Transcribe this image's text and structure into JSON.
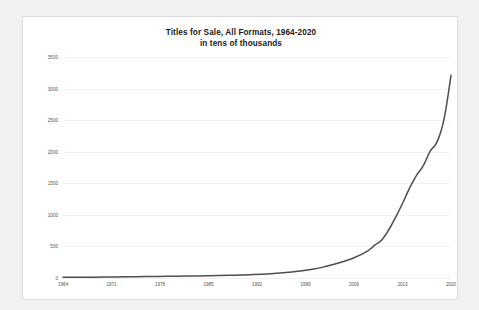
{
  "chart_data": {
    "type": "line",
    "title": "Titles for Sale, All Formats, 1964-2020",
    "subtitle": "in tens of thousands",
    "xlabel": "",
    "ylabel": "",
    "ylim": [
      0,
      3500
    ],
    "xlim": [
      1964,
      2020
    ],
    "ytick_labels": [
      "0",
      "500",
      "1000",
      "1500",
      "2000",
      "2500",
      "3000",
      "3500"
    ],
    "ytick_values": [
      0,
      500,
      1000,
      1500,
      2000,
      2500,
      3000,
      3500
    ],
    "xtick_labels": [
      "1964",
      "1971",
      "1978",
      "1985",
      "1992",
      "1999",
      "2006",
      "2013",
      "2020"
    ],
    "xtick_values": [
      1964,
      1971,
      1978,
      1985,
      1992,
      1999,
      2006,
      2013,
      2020
    ],
    "grid": "horizontal",
    "legend": "none",
    "line_color": "#4d4d4d",
    "series": [
      {
        "name": "Titles for Sale, All Formats",
        "x": [
          1964,
          1967,
          1970,
          1973,
          1976,
          1979,
          1982,
          1985,
          1988,
          1991,
          1994,
          1997,
          2000,
          2002,
          2004,
          2006,
          2008,
          2009,
          2010,
          2011,
          2012,
          2013,
          2014,
          2015,
          2016,
          2017,
          2018,
          2019,
          2020
        ],
        "values": [
          10,
          12,
          15,
          18,
          22,
          26,
          30,
          35,
          42,
          52,
          68,
          95,
          140,
          185,
          245,
          320,
          430,
          520,
          600,
          760,
          960,
          1180,
          1420,
          1620,
          1780,
          2010,
          2160,
          2520,
          3210
        ]
      }
    ]
  },
  "canvas": {
    "background_color": "#f1f1f1",
    "panel_color": "#ffffff",
    "border_color": "#dcdcdc",
    "gridline_color": "#f2f2f2",
    "tick_label_color": "#555555",
    "title_color": "#1a1a1a"
  }
}
